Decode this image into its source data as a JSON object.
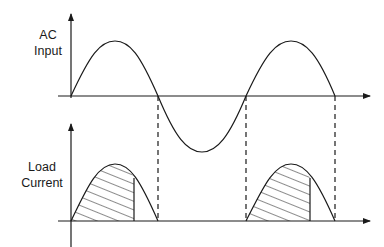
{
  "diagram": {
    "top_panel": {
      "label_line1": "AC",
      "label_line2": "Input",
      "signal": "sine"
    },
    "bottom_panel": {
      "label_line1": "Load",
      "label_line2": "Current",
      "signal": "half-wave rectified, partially hatched"
    },
    "colors": {
      "line": "#1a1a1a",
      "background": "#ffffff"
    }
  }
}
